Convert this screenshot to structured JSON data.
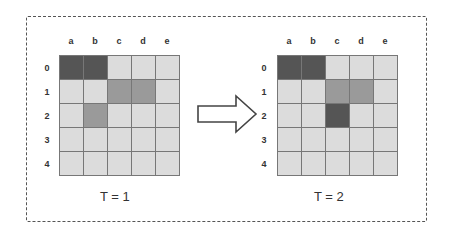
{
  "diagram": {
    "columns": [
      "a",
      "b",
      "c",
      "d",
      "e"
    ],
    "rows": [
      "0",
      "1",
      "2",
      "3",
      "4"
    ],
    "panels": [
      {
        "caption": "T = 1",
        "cells": [
          [
            "dark",
            "dark",
            "light",
            "light",
            "light"
          ],
          [
            "light",
            "light",
            "mid",
            "mid",
            "light"
          ],
          [
            "light",
            "mid",
            "light",
            "light",
            "light"
          ],
          [
            "light",
            "light",
            "light",
            "light",
            "light"
          ],
          [
            "light",
            "light",
            "light",
            "light",
            "light"
          ]
        ]
      },
      {
        "caption": "T = 2",
        "cells": [
          [
            "dark",
            "dark",
            "light",
            "light",
            "light"
          ],
          [
            "light",
            "light",
            "mid",
            "mid",
            "light"
          ],
          [
            "light",
            "light",
            "dark",
            "light",
            "light"
          ],
          [
            "light",
            "light",
            "light",
            "light",
            "light"
          ],
          [
            "light",
            "light",
            "light",
            "light",
            "light"
          ]
        ]
      }
    ],
    "arrow_icon": "right-arrow-outline-icon",
    "colors": {
      "dark": "#555555",
      "mid": "#9a9a9a",
      "light": "#dcdcdc",
      "grid_line": "#777777"
    }
  }
}
